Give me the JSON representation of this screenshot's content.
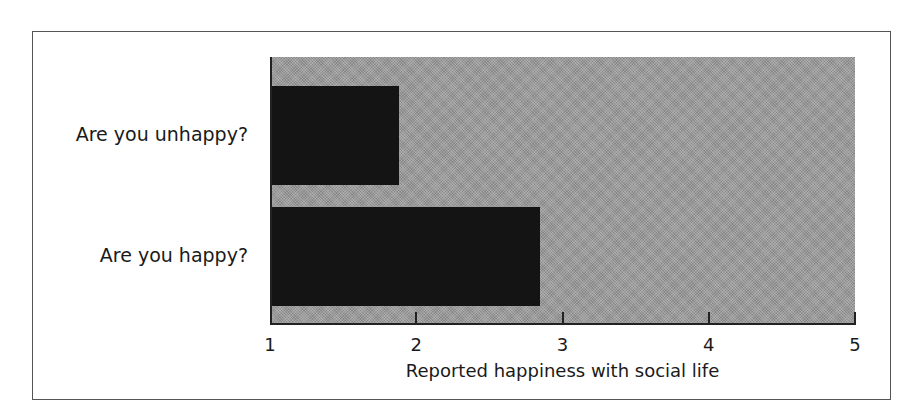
{
  "chart_data": {
    "type": "bar",
    "orientation": "horizontal",
    "title": "",
    "categories": [
      "Are you unhappy?",
      "Are you happy?"
    ],
    "values": [
      1.87,
      2.83
    ],
    "xlabel": "Reported happiness with social life",
    "ylabel": "",
    "xlim": [
      1,
      5
    ],
    "xticks": [
      "1",
      "2",
      "3",
      "4",
      "5"
    ],
    "grid": false,
    "legend": null,
    "colors": {
      "bar": "#141414",
      "plot_background": "#9a9a9a",
      "frame": "#555555"
    }
  }
}
